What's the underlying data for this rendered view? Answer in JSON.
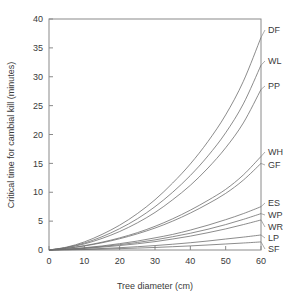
{
  "figure": {
    "background": "#ffffff",
    "line_color": "#6f6f6f",
    "axis_color": "#8a8a8a",
    "text_color": "#3a3a3a"
  },
  "chart_data": {
    "type": "line",
    "title": "",
    "xlabel": "Tree diameter (cm)",
    "ylabel": "Critical time for cambial kill (minutes)",
    "xlim": [
      0,
      60
    ],
    "ylim": [
      0,
      40
    ],
    "xticks": [
      0,
      10,
      20,
      30,
      40,
      50,
      60
    ],
    "yticks": [
      0,
      5,
      10,
      15,
      20,
      25,
      30,
      35,
      40
    ],
    "xtick_labels": [
      "0",
      "10",
      "20",
      "30",
      "40",
      "50",
      "60"
    ],
    "ytick_labels": [
      "0",
      "5",
      "10",
      "15",
      "20",
      "25",
      "30",
      "35",
      "40"
    ],
    "grid": false,
    "legend_position": "right-outside-labels",
    "x": [
      0,
      5,
      10,
      15,
      20,
      25,
      30,
      35,
      40,
      45,
      50,
      55,
      60
    ],
    "series": [
      {
        "name": "DF",
        "label": "DF",
        "end_value": 36.8,
        "values": [
          0,
          0.5,
          1.4,
          2.7,
          4.3,
          6.3,
          8.7,
          11.6,
          14.9,
          18.8,
          23.4,
          29.2,
          36.8
        ]
      },
      {
        "name": "WL",
        "label": "WL",
        "end_value": 32.0,
        "values": [
          0,
          0.45,
          1.2,
          2.3,
          3.7,
          5.4,
          7.5,
          10.0,
          12.9,
          16.3,
          20.3,
          25.3,
          32.0
        ]
      },
      {
        "name": "PP",
        "label": "PP",
        "end_value": 27.8,
        "values": [
          0,
          0.4,
          1.05,
          2.0,
          3.2,
          4.7,
          6.5,
          8.7,
          11.2,
          14.2,
          17.7,
          22.0,
          27.8
        ]
      },
      {
        "name": "WH",
        "label": "WH",
        "end_value": 16.2,
        "values": [
          0,
          0.3,
          0.75,
          1.35,
          2.1,
          3.0,
          4.1,
          5.4,
          6.9,
          8.6,
          10.5,
          13.0,
          16.2
        ]
      },
      {
        "name": "GF",
        "label": "GF",
        "end_value": 15.0,
        "values": [
          0,
          0.28,
          0.7,
          1.25,
          1.95,
          2.8,
          3.8,
          5.0,
          6.4,
          8.0,
          9.8,
          12.1,
          15.0
        ]
      },
      {
        "name": "ES",
        "label": "ES",
        "end_value": 7.5,
        "values": [
          0,
          0.15,
          0.4,
          0.7,
          1.1,
          1.55,
          2.1,
          2.7,
          3.45,
          4.3,
          5.25,
          6.3,
          7.5
        ]
      },
      {
        "name": "WP",
        "label": "WP",
        "end_value": 6.3,
        "values": [
          0,
          0.13,
          0.33,
          0.6,
          0.93,
          1.3,
          1.75,
          2.3,
          2.9,
          3.6,
          4.4,
          5.3,
          6.3
        ]
      },
      {
        "name": "WR",
        "label": "WR",
        "end_value": 5.2,
        "values": [
          0,
          0.11,
          0.27,
          0.5,
          0.77,
          1.08,
          1.45,
          1.9,
          2.4,
          3.0,
          3.65,
          4.4,
          5.2
        ]
      },
      {
        "name": "LP",
        "label": "LP",
        "end_value": 2.6,
        "values": [
          0,
          0.06,
          0.14,
          0.26,
          0.4,
          0.57,
          0.77,
          1.0,
          1.26,
          1.56,
          1.9,
          2.23,
          2.6
        ]
      },
      {
        "name": "SF",
        "label": "SF",
        "end_value": 1.4,
        "values": [
          0,
          0.03,
          0.08,
          0.15,
          0.23,
          0.33,
          0.44,
          0.57,
          0.71,
          0.87,
          1.04,
          1.21,
          1.4
        ]
      }
    ]
  }
}
